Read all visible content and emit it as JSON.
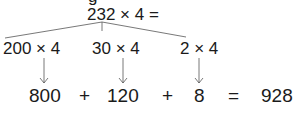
{
  "diagram": {
    "type": "partial-products-multiplication",
    "top_fragment": "g",
    "expression": "232 × 4 =",
    "partials": [
      {
        "label": "200 × 4",
        "result": "800"
      },
      {
        "label": "30 × 4",
        "result": "120"
      },
      {
        "label": "2 × 4",
        "result": "8"
      }
    ],
    "operators": [
      "+",
      "+",
      "="
    ],
    "total": "928",
    "line_color": "#555555",
    "text_color": "#1a1a1a"
  }
}
